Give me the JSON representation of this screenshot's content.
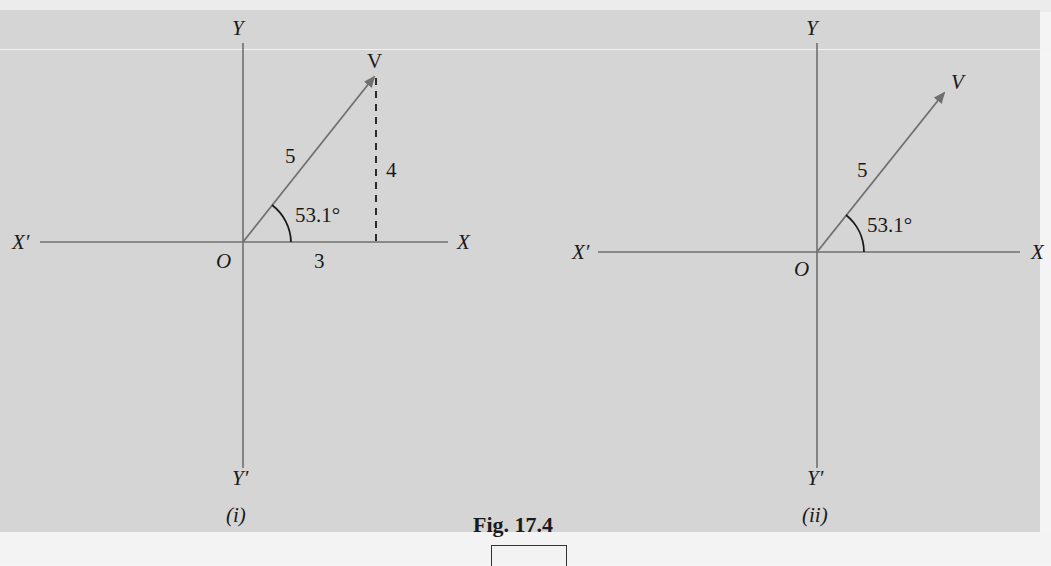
{
  "figure": {
    "caption": "Fig. 17.4",
    "panels": [
      {
        "id": "i",
        "caption": "(i)",
        "axes": {
          "x_pos": "X",
          "x_neg": "X′",
          "y_pos": "Y",
          "y_neg": "Y′",
          "origin": "O"
        },
        "vector": {
          "label": "V",
          "magnitude_label": "5",
          "angle_label": "53.1°"
        },
        "components": {
          "horizontal_label": "3",
          "vertical_label": "4",
          "vertical_style": "dashed"
        }
      },
      {
        "id": "ii",
        "caption": "(ii)",
        "axes": {
          "x_pos": "X",
          "x_neg": "X′",
          "y_pos": "Y",
          "y_neg": "Y′",
          "origin": "O"
        },
        "vector": {
          "label": "V",
          "magnitude_label": "5",
          "angle_label": "53.1°"
        }
      }
    ]
  },
  "colors": {
    "background": "#d5d5d5",
    "axis": "#6f6f6f",
    "vector": "#707070",
    "text": "#1a1a1a"
  }
}
